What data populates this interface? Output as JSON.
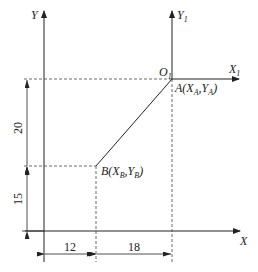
{
  "diagram": {
    "type": "coordinate-geometry",
    "axes": {
      "y_label": "Y",
      "x_label": "X",
      "y1_label": "Y",
      "y1_sub": "1",
      "x1_label": "X",
      "x1_sub": "1",
      "origin1_label": "O",
      "origin1_sub": "1"
    },
    "points": {
      "A": {
        "prefix": "A(X",
        "sub1": "A",
        "mid": ",Y",
        "sub2": "A",
        "suffix": ")"
      },
      "B": {
        "prefix": "B(X",
        "sub1": "B",
        "mid": ",Y",
        "sub2": "B",
        "suffix": ")"
      }
    },
    "dimensions": {
      "vertical_upper": "20",
      "vertical_lower": "15",
      "horizontal_left": "12",
      "horizontal_right": "18"
    },
    "colors": {
      "line": "#222222",
      "dashed": "#444444"
    }
  }
}
